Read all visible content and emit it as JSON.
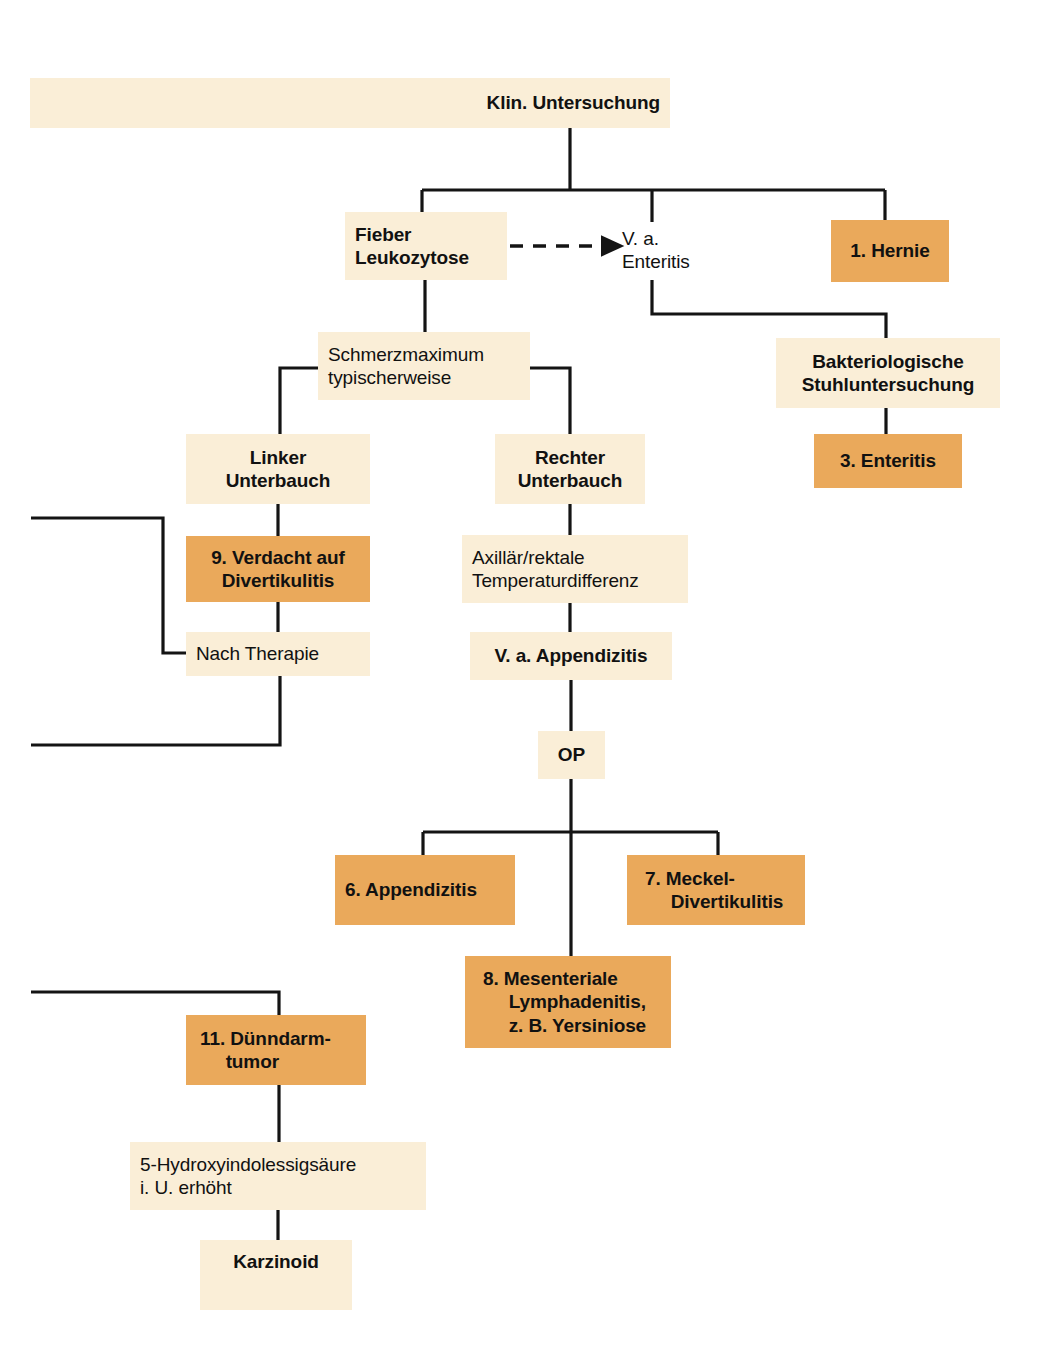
{
  "diagram": {
    "title": "Klin. Untersuchung",
    "language": "de",
    "palette": {
      "cream": "#faeed7",
      "orange": "#eaa95b",
      "line": "#141414",
      "text": "#111111",
      "background": "#ffffff"
    },
    "nodes": [
      {
        "id": "klin",
        "label": "Klin. Untersuchung",
        "lines": [
          "Klin. Untersuchung"
        ],
        "style": "cream",
        "weight": "bold",
        "align": "right",
        "x": 30,
        "y": 78,
        "w": 640,
        "h": 50
      },
      {
        "id": "fieber",
        "label": "Fieber Leukozytose",
        "lines": [
          "Fieber",
          "Leukozytose"
        ],
        "style": "cream",
        "weight": "bold",
        "align": "left",
        "x": 345,
        "y": 212,
        "w": 162,
        "h": 68
      },
      {
        "id": "va-enteritis",
        "label": "V. a. Enteritis",
        "lines": [
          "V. a.",
          "Enteritis"
        ],
        "style": "plain",
        "weight": "normal",
        "align": "left",
        "x": 622,
        "y": 222,
        "w": 120,
        "h": 56
      },
      {
        "id": "hernie",
        "label": "1. Hernie",
        "lines": [
          "1. Hernie"
        ],
        "style": "orange",
        "weight": "bold",
        "align": "center",
        "x": 831,
        "y": 220,
        "w": 118,
        "h": 62
      },
      {
        "id": "bakt",
        "label": "Bakteriologische Stuhluntersuchung",
        "lines": [
          "Bakteriologische",
          "Stuhluntersuchung"
        ],
        "style": "cream",
        "weight": "bold",
        "align": "center",
        "x": 776,
        "y": 338,
        "w": 224,
        "h": 70
      },
      {
        "id": "enteritis3",
        "label": "3. Enteritis",
        "lines": [
          "3. Enteritis"
        ],
        "style": "orange",
        "weight": "bold",
        "align": "center",
        "x": 814,
        "y": 434,
        "w": 148,
        "h": 54
      },
      {
        "id": "schmerz",
        "label": "Schmerzmaximum typischerweise",
        "lines": [
          "Schmerzmaximum",
          "typischerweise"
        ],
        "style": "cream",
        "weight": "normal",
        "align": "left",
        "x": 318,
        "y": 332,
        "w": 212,
        "h": 68
      },
      {
        "id": "links",
        "label": "Linker Unterbauch",
        "lines": [
          "Linker",
          "Unterbauch"
        ],
        "style": "cream",
        "weight": "bold",
        "align": "center",
        "x": 186,
        "y": 434,
        "w": 184,
        "h": 70
      },
      {
        "id": "divert9",
        "label": "9. Verdacht auf Divertikulitis",
        "lines": [
          "9. Verdacht auf",
          "Divertikulitis"
        ],
        "style": "orange",
        "weight": "bold",
        "align": "center",
        "x": 186,
        "y": 536,
        "w": 184,
        "h": 66
      },
      {
        "id": "nachther",
        "label": "Nach Therapie",
        "lines": [
          "Nach Therapie"
        ],
        "style": "cream",
        "weight": "normal",
        "align": "left",
        "x": 186,
        "y": 632,
        "w": 184,
        "h": 44
      },
      {
        "id": "rechts",
        "label": "Rechter Unterbauch",
        "lines": [
          "Rechter",
          "Unterbauch"
        ],
        "style": "cream",
        "weight": "bold",
        "align": "center",
        "x": 495,
        "y": 434,
        "w": 150,
        "h": 70
      },
      {
        "id": "axill",
        "label": "Axillär/rektale Temperaturdifferenz",
        "lines": [
          "Axillär/rektale",
          "Temperaturdifferenz"
        ],
        "style": "cream",
        "weight": "normal",
        "align": "left",
        "x": 462,
        "y": 535,
        "w": 226,
        "h": 68
      },
      {
        "id": "va-appen",
        "label": "V. a. Appendizitis",
        "lines": [
          "V. a. Appendizitis"
        ],
        "style": "cream",
        "weight": "bold",
        "align": "center",
        "x": 470,
        "y": 632,
        "w": 202,
        "h": 48
      },
      {
        "id": "op",
        "label": "OP",
        "lines": [
          "OP"
        ],
        "style": "cream",
        "weight": "bold",
        "align": "center",
        "x": 538,
        "y": 731,
        "w": 67,
        "h": 48
      },
      {
        "id": "appen6",
        "label": "6. Appendizitis",
        "lines": [
          "6. Appendizitis"
        ],
        "style": "orange",
        "weight": "bold",
        "align": "left",
        "x": 335,
        "y": 855,
        "w": 180,
        "h": 70
      },
      {
        "id": "meckel7",
        "label": "7. Meckel-Divertikulitis",
        "lines": [
          "7. Meckel-",
          "Divertikulitis"
        ],
        "style": "orange",
        "weight": "bold",
        "align": "left",
        "x": 627,
        "y": 855,
        "w": 178,
        "h": 70,
        "hanging": true
      },
      {
        "id": "mesent8",
        "label": "8. Mesenteriale Lymphadenitis, z. B. Yersiniose",
        "lines": [
          "8. Mesenteriale",
          "Lymphadenitis,",
          "z. B. Yersiniose"
        ],
        "style": "orange",
        "weight": "bold",
        "align": "left",
        "x": 465,
        "y": 956,
        "w": 206,
        "h": 92,
        "hanging": true
      },
      {
        "id": "duenn11",
        "label": "11. Dünndarmtumor",
        "lines": [
          "11. Dünndarm-",
          "tumor"
        ],
        "style": "orange",
        "weight": "bold",
        "align": "left",
        "x": 186,
        "y": 1015,
        "w": 180,
        "h": 70,
        "hanging": true
      },
      {
        "id": "hydroxy",
        "label": "5-Hydroxyindolessigsäure i. U. erhöht",
        "lines": [
          "5-Hydroxyindolessigsäure",
          "i. U. erhöht"
        ],
        "style": "cream",
        "weight": "normal",
        "align": "left",
        "x": 130,
        "y": 1142,
        "w": 296,
        "h": 68
      },
      {
        "id": "karzinoid",
        "label": "Karzinoid",
        "lines": [
          "Karzinoid"
        ],
        "style": "cream",
        "weight": "bold",
        "align": "center",
        "x": 200,
        "y": 1240,
        "w": 152,
        "h": 70
      }
    ],
    "edges": [
      {
        "id": "e-klin-bar",
        "from": "klin",
        "to": "branch-bar-1",
        "kind": "solid"
      },
      {
        "id": "e-bar-fieber",
        "from": "branch-bar-1",
        "to": "fieber",
        "kind": "solid"
      },
      {
        "id": "e-bar-enteritis",
        "from": "branch-bar-1",
        "to": "va-enteritis",
        "kind": "solid"
      },
      {
        "id": "e-bar-hernie",
        "from": "branch-bar-1",
        "to": "hernie",
        "kind": "solid"
      },
      {
        "id": "e-fieber-ent",
        "from": "fieber",
        "to": "va-enteritis",
        "kind": "dashed-arrow"
      },
      {
        "id": "e-ent-bakt",
        "from": "va-enteritis",
        "to": "bakt",
        "kind": "solid"
      },
      {
        "id": "e-bakt-ent3",
        "from": "bakt",
        "to": "enteritis3",
        "kind": "solid"
      },
      {
        "id": "e-fieber-schmerz",
        "from": "fieber",
        "to": "schmerz",
        "kind": "solid"
      },
      {
        "id": "e-schmerz-links",
        "from": "schmerz",
        "to": "links",
        "kind": "solid"
      },
      {
        "id": "e-schmerz-rechts",
        "from": "schmerz",
        "to": "rechts",
        "kind": "solid"
      },
      {
        "id": "e-links-div9",
        "from": "links",
        "to": "divert9",
        "kind": "solid"
      },
      {
        "id": "e-div9-nach",
        "from": "divert9",
        "to": "nachther",
        "kind": "solid"
      },
      {
        "id": "e-nach-in",
        "from": "offpage-left",
        "to": "nachther",
        "kind": "solid"
      },
      {
        "id": "e-nach-out",
        "from": "nachther",
        "to": "offpage-left",
        "kind": "solid"
      },
      {
        "id": "e-rechts-axill",
        "from": "rechts",
        "to": "axill",
        "kind": "solid"
      },
      {
        "id": "e-axill-appen",
        "from": "axill",
        "to": "va-appen",
        "kind": "solid"
      },
      {
        "id": "e-appen-op",
        "from": "va-appen",
        "to": "op",
        "kind": "solid"
      },
      {
        "id": "e-op-bar",
        "from": "op",
        "to": "branch-bar-2",
        "kind": "solid"
      },
      {
        "id": "e-bar2-6",
        "from": "branch-bar-2",
        "to": "appen6",
        "kind": "solid"
      },
      {
        "id": "e-bar2-7",
        "from": "branch-bar-2",
        "to": "meckel7",
        "kind": "solid"
      },
      {
        "id": "e-bar2-8",
        "from": "branch-bar-2",
        "to": "mesent8",
        "kind": "solid"
      },
      {
        "id": "e-offpage-11",
        "from": "offpage-left",
        "to": "duenn11",
        "kind": "solid"
      },
      {
        "id": "e-11-hydroxy",
        "from": "duenn11",
        "to": "hydroxy",
        "kind": "solid"
      },
      {
        "id": "e-hydroxy-karz",
        "from": "hydroxy",
        "to": "karzinoid",
        "kind": "solid"
      }
    ]
  }
}
